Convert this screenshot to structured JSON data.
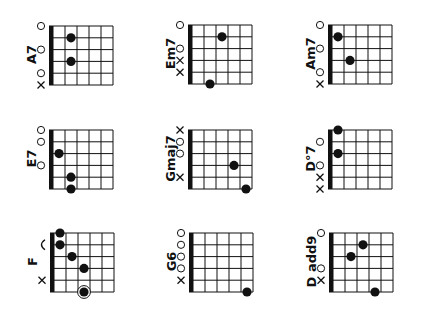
{
  "page": {
    "background": "#ffffff",
    "ink": "#111111"
  },
  "chords": [
    {
      "name": "A7",
      "grid_origin": [
        53,
        26
      ],
      "markers": [
        {
          "row": 0,
          "type": "open"
        },
        {
          "row": 2,
          "type": "open"
        },
        {
          "row": 4,
          "type": "open"
        },
        {
          "row": 5,
          "type": "mute"
        }
      ],
      "dots": [
        {
          "row": 1,
          "fret": 1
        },
        {
          "row": 3,
          "fret": 1
        }
      ]
    },
    {
      "name": "Em7",
      "grid_origin": [
        192,
        25
      ],
      "markers": [
        {
          "row": 0,
          "type": "open"
        },
        {
          "row": 2,
          "type": "open"
        },
        {
          "row": 3,
          "type": "mute"
        },
        {
          "row": 4,
          "type": "mute"
        }
      ],
      "dots": [
        {
          "row": 1,
          "fret": 2
        },
        {
          "row": 5,
          "fret": 1
        }
      ]
    },
    {
      "name": "Am7",
      "grid_origin": [
        332,
        25
      ],
      "markers": [
        {
          "row": 0,
          "type": "open"
        },
        {
          "row": 2,
          "type": "open"
        },
        {
          "row": 4,
          "type": "open"
        },
        {
          "row": 5,
          "type": "mute"
        }
      ],
      "dots": [
        {
          "row": 1,
          "fret": 0
        },
        {
          "row": 3,
          "fret": 1
        }
      ]
    },
    {
      "name": "E7",
      "grid_origin": [
        53,
        130
      ],
      "markers": [
        {
          "row": 0,
          "type": "open"
        },
        {
          "row": 1,
          "type": "open"
        },
        {
          "row": 3,
          "type": "open"
        }
      ],
      "dots": [
        {
          "row": 2,
          "fret": 0
        },
        {
          "row": 4,
          "fret": 1
        },
        {
          "row": 5,
          "fret": 1
        }
      ]
    },
    {
      "name": "Gmaj7",
      "grid_origin": [
        192,
        130
      ],
      "markers": [
        {
          "row": 0,
          "type": "mute"
        },
        {
          "row": 1,
          "type": "open"
        },
        {
          "row": 2,
          "type": "open"
        },
        {
          "row": 4,
          "type": "mute"
        }
      ],
      "dots": [
        {
          "row": 3,
          "fret": 3
        },
        {
          "row": 5,
          "fret": 4
        }
      ]
    },
    {
      "name": "D°7",
      "grid_origin": [
        332,
        130
      ],
      "markers": [
        {
          "row": 1,
          "type": "open"
        },
        {
          "row": 3,
          "type": "open"
        },
        {
          "row": 4,
          "type": "mute"
        },
        {
          "row": 5,
          "type": "mute"
        }
      ],
      "dots": [
        {
          "row": 0,
          "fret": 0
        },
        {
          "row": 2,
          "fret": 0
        }
      ]
    },
    {
      "name": "F",
      "grid_origin": [
        54,
        233
      ],
      "markers": [
        {
          "row": 1,
          "type": "barre"
        },
        {
          "row": 4,
          "type": "mute"
        }
      ],
      "dots": [
        {
          "row": 0,
          "fret": 0
        },
        {
          "row": 1,
          "fret": 0
        },
        {
          "row": 2,
          "fret": 1
        },
        {
          "row": 3,
          "fret": 2
        },
        {
          "row": 5,
          "fret": 2,
          "ringed": true
        }
      ]
    },
    {
      "name": "G6",
      "grid_origin": [
        193,
        233
      ],
      "markers": [
        {
          "row": 0,
          "type": "open"
        },
        {
          "row": 1,
          "type": "open"
        },
        {
          "row": 2,
          "type": "open"
        },
        {
          "row": 3,
          "type": "open"
        },
        {
          "row": 4,
          "type": "mute"
        }
      ],
      "dots": [
        {
          "row": 5,
          "fret": 4
        }
      ]
    },
    {
      "name": "D add9",
      "grid_origin": [
        333,
        233
      ],
      "markers": [
        {
          "row": 0,
          "type": "open"
        },
        {
          "row": 3,
          "type": "open"
        },
        {
          "row": 4,
          "type": "mute"
        }
      ],
      "dots": [
        {
          "row": 1,
          "fret": 2
        },
        {
          "row": 2,
          "fret": 1
        },
        {
          "row": 5,
          "fret": 3
        }
      ]
    }
  ],
  "grid_spec": {
    "strings": 6,
    "frets": 5,
    "cell_width": 12,
    "row_spacing": 11.8,
    "nut_width": 4,
    "dot_radius": 4.6
  }
}
